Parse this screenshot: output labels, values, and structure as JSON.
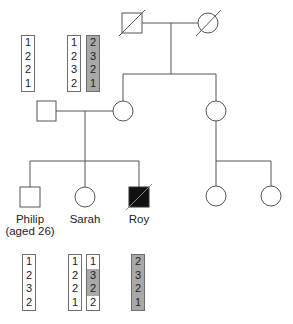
{
  "colors": {
    "line": "#555555",
    "affected_fill": "#111111",
    "haplotype_shaded": "#a8a8a8",
    "background": "#ffffff"
  },
  "individuals": {
    "grandfather": {
      "sex": "male",
      "deceased": true,
      "affected": false
    },
    "grandmother": {
      "sex": "female",
      "deceased": true,
      "affected": false
    },
    "father": {
      "sex": "male",
      "deceased": false,
      "affected": false
    },
    "mother": {
      "sex": "female",
      "deceased": false,
      "affected": false
    },
    "aunt": {
      "sex": "female",
      "deceased": false,
      "affected": false
    },
    "philip": {
      "sex": "male",
      "name": "Philip",
      "age_label": "(aged 26)",
      "affected": false
    },
    "sarah": {
      "sex": "female",
      "name": "Sarah",
      "affected": false
    },
    "roy": {
      "sex": "male",
      "name": "Roy",
      "deceased": true,
      "affected": true
    },
    "cousin1": {
      "sex": "female",
      "affected": false
    },
    "cousin2": {
      "sex": "female",
      "affected": false
    }
  },
  "haplotypes": {
    "father": [
      {
        "alleles": [
          "1",
          "2",
          "2",
          "1"
        ],
        "shaded": [
          false,
          false,
          false,
          false
        ]
      }
    ],
    "mother": [
      {
        "alleles": [
          "1",
          "2",
          "3",
          "2"
        ],
        "shaded": [
          false,
          false,
          false,
          false
        ]
      },
      {
        "alleles": [
          "2",
          "3",
          "2",
          "1"
        ],
        "shaded": [
          true,
          true,
          true,
          true
        ]
      }
    ],
    "philip": [
      {
        "alleles": [
          "1",
          "2",
          "3",
          "2"
        ],
        "shaded": [
          false,
          false,
          false,
          false
        ]
      }
    ],
    "sarah": [
      {
        "alleles": [
          "1",
          "2",
          "2",
          "1"
        ],
        "shaded": [
          false,
          false,
          false,
          false
        ]
      },
      {
        "alleles": [
          "1",
          "3",
          "2",
          "2"
        ],
        "shaded": [
          false,
          true,
          true,
          false
        ]
      }
    ],
    "roy": [
      {
        "alleles": [
          "2",
          "3",
          "2",
          "1"
        ],
        "shaded": [
          true,
          true,
          true,
          true
        ]
      }
    ]
  }
}
